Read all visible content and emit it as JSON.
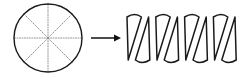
{
  "figure": {
    "caption": "",
    "background_color": "#ffffff",
    "width": 241,
    "height": 77
  },
  "colors": {
    "outline": "#1a1a1a",
    "spoke": "#8c8c8c",
    "arrow": "#111111",
    "background": "#ffffff"
  },
  "left_shape": {
    "name": "sectored-circle",
    "label": "",
    "center_x": 48,
    "center_y": 38,
    "radius": 34,
    "sector_count": 8,
    "sector_angle_degrees": 45,
    "outline_width": 1.4,
    "spoke_style": "dotted",
    "spoke_width": 0.9,
    "spoke_angles_degrees": [
      0,
      45,
      90,
      135,
      180,
      225,
      270,
      315
    ]
  },
  "arrow": {
    "name": "transformation-arrow",
    "label": "",
    "x_start": 91,
    "x_end": 121,
    "y": 38,
    "head_length": 7,
    "head_half_width": 3.6,
    "shaft_width": 1.5
  },
  "right_shape": {
    "name": "rearranged-sector-strip",
    "label": "",
    "x_start": 121,
    "x_end": 236,
    "y_top": 17,
    "y_bottom": 60,
    "wedge_count": 8,
    "wedge_width": 14.4,
    "arc_bulge": 5.0,
    "outline_width": 1.5,
    "skew_offset": 6,
    "description": "Eight circular sectors alternately pointing up and down, arranged side by side to approximate a parallelogram."
  }
}
